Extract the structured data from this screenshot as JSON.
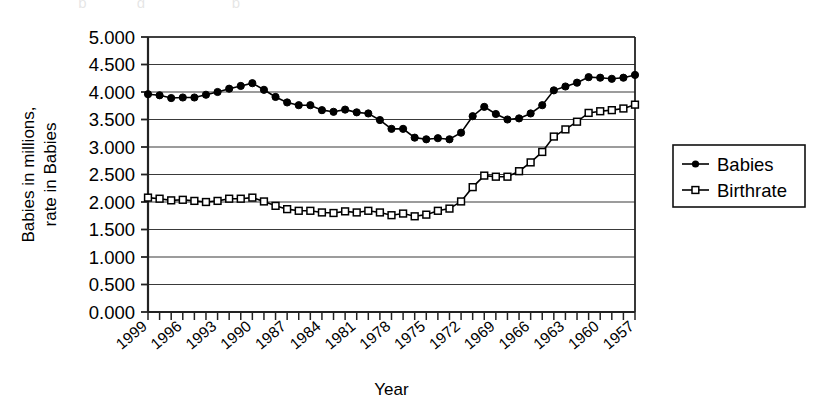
{
  "axes": {
    "y_title_line1": "Babies in millions,",
    "y_title_line2": "rate in Babies",
    "x_title": "Year",
    "y_ticks": [
      "5.000",
      "4.500",
      "4.000",
      "3.500",
      "3.000",
      "2.500",
      "2.000",
      "1.500",
      "1.000",
      "0.500",
      "0.000"
    ],
    "x_ticks": [
      "1999",
      "1996",
      "1993",
      "1990",
      "1987",
      "1984",
      "1981",
      "1978",
      "1975",
      "1972",
      "1969",
      "1966",
      "1963",
      "1960",
      "1957"
    ]
  },
  "legend": {
    "items": [
      {
        "label": "Babies",
        "marker": "filled-circle",
        "color": "#000000"
      },
      {
        "label": "Birthrate",
        "marker": "open-square",
        "color": "#000000"
      }
    ]
  },
  "chart_data": {
    "type": "line",
    "title": "",
    "xlabel": "Year",
    "ylabel": "Babies in millions, rate in Babies",
    "ylim": [
      0.0,
      5.0
    ],
    "ytick_step": 0.5,
    "grid": true,
    "grid_axis": "y",
    "legend_position": "right",
    "x_order": "descending",
    "x": [
      1999,
      1998,
      1997,
      1996,
      1995,
      1994,
      1993,
      1992,
      1991,
      1990,
      1989,
      1988,
      1987,
      1986,
      1985,
      1984,
      1983,
      1982,
      1981,
      1980,
      1979,
      1978,
      1977,
      1976,
      1975,
      1974,
      1973,
      1972,
      1971,
      1970,
      1969,
      1968,
      1967,
      1966,
      1965,
      1964,
      1963,
      1962,
      1961,
      1960,
      1959,
      1958,
      1957
    ],
    "series": [
      {
        "name": "Babies",
        "marker": "filled-circle",
        "color": "#000000",
        "values": [
          3.96,
          3.94,
          3.89,
          3.9,
          3.9,
          3.95,
          4.0,
          4.06,
          4.11,
          4.16,
          4.04,
          3.91,
          3.81,
          3.76,
          3.76,
          3.67,
          3.64,
          3.68,
          3.63,
          3.61,
          3.49,
          3.33,
          3.33,
          3.17,
          3.14,
          3.16,
          3.14,
          3.26,
          3.56,
          3.73,
          3.6,
          3.5,
          3.52,
          3.61,
          3.76,
          4.03,
          4.1,
          4.17,
          4.27,
          4.26,
          4.24,
          4.26,
          4.31
        ]
      },
      {
        "name": "Birthrate",
        "marker": "open-square",
        "color": "#000000",
        "values": [
          2.08,
          2.06,
          2.03,
          2.04,
          2.02,
          2.0,
          2.02,
          2.06,
          2.06,
          2.08,
          2.01,
          1.93,
          1.87,
          1.84,
          1.84,
          1.81,
          1.8,
          1.83,
          1.81,
          1.84,
          1.81,
          1.76,
          1.79,
          1.74,
          1.77,
          1.84,
          1.88,
          2.01,
          2.27,
          2.48,
          2.46,
          2.46,
          2.56,
          2.72,
          2.91,
          3.19,
          3.32,
          3.46,
          3.62,
          3.65,
          3.67,
          3.7,
          3.77
        ]
      }
    ]
  }
}
